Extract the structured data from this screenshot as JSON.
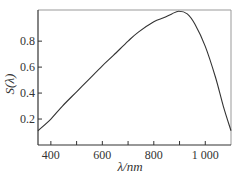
{
  "chart_data": {
    "type": "line",
    "title": "",
    "xlabel": "λ/nm",
    "ylabel": "S(λ)",
    "xlim": [
      350,
      1100
    ],
    "ylim": [
      0.0,
      1.04
    ],
    "x_ticks": [
      400,
      500,
      600,
      700,
      800,
      900,
      1000
    ],
    "x_tick_labels": [
      "400",
      "",
      "600",
      "",
      "800",
      "",
      "1 000"
    ],
    "y_ticks": [
      0.2,
      0.4,
      0.6,
      0.8
    ],
    "y_tick_labels": [
      "0.2",
      "0.4",
      "0.6",
      "0.8"
    ],
    "grid": false,
    "legend": "none",
    "series": [
      {
        "name": "S(λ)",
        "color": "#333333",
        "x": [
          350,
          400,
          445,
          500,
          545,
          600,
          643,
          700,
          740,
          800,
          838,
          870,
          897,
          930,
          960,
          1000,
          1040,
          1070,
          1100
        ],
        "y": [
          0.11,
          0.2,
          0.3,
          0.41,
          0.5,
          0.61,
          0.69,
          0.8,
          0.87,
          0.95,
          0.98,
          1.01,
          1.03,
          1.01,
          0.93,
          0.76,
          0.52,
          0.3,
          0.11
        ]
      }
    ]
  }
}
